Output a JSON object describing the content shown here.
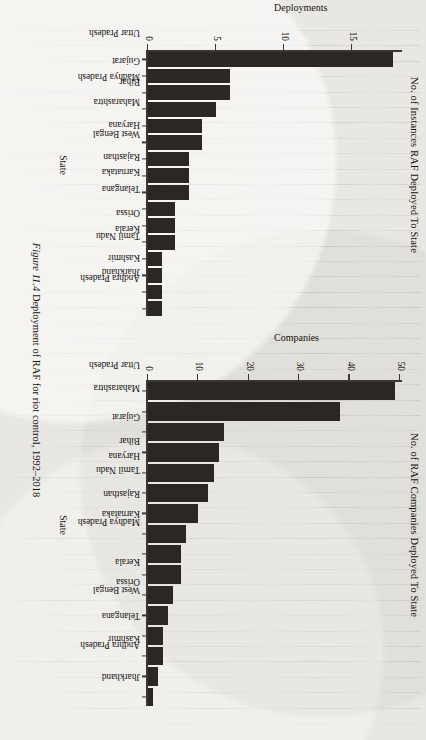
{
  "figure": {
    "caption_label": "Figure 11.4",
    "caption_text": "Deployment of RAF for riot control, 1992–2018"
  },
  "chart_data": [
    {
      "id": "instances",
      "type": "bar",
      "orientation": "vertical",
      "title": "No. of Instances RAF Deployed To State",
      "xlabel": "State",
      "ylabel": "Deployments",
      "ylim": [
        0,
        18.5
      ],
      "yticks": [
        0,
        5,
        10,
        15
      ],
      "grid": false,
      "legend": "none",
      "bar_color": "#2a2724",
      "categories": [
        "Uttar Pradesh",
        "Gujarat",
        "Bihar",
        "Madhya Pradesh",
        "Maharashtra",
        "Haryana",
        "West Bengal",
        "Rajasthan",
        "Karnataka",
        "Telangana",
        "Orissa",
        "Kerala",
        "Tamil Nadu",
        "Kashmir",
        "Jharkhand",
        "Andhra Pradesh"
      ],
      "values": [
        18,
        6,
        6,
        5,
        4,
        4,
        3,
        3,
        3,
        2,
        2,
        2,
        1,
        1,
        1,
        1
      ]
    },
    {
      "id": "companies",
      "type": "bar",
      "orientation": "vertical",
      "title": "No. of RAF Companies Deployed To State",
      "xlabel": "State",
      "ylabel": "Companies",
      "ylim": [
        0,
        50
      ],
      "yticks": [
        0,
        10,
        20,
        30,
        40,
        50
      ],
      "grid": false,
      "legend": "none",
      "bar_color": "#2a2724",
      "categories": [
        "Uttar Pradesh",
        "Maharashtra",
        "Gujarat",
        "Bihar",
        "Haryana",
        "Tamil Nadu",
        "Rajasthan",
        "Karnataka",
        "Madhya Pradesh",
        "Kerala",
        "Orissa",
        "West Bengal",
        "Telangana",
        "Kashmir",
        "Andhra Pradesh",
        "Jharkhand"
      ],
      "values": [
        49,
        38,
        15,
        14,
        13,
        12,
        10,
        7.5,
        6.5,
        6.5,
        5,
        4,
        3,
        3,
        2,
        1
      ]
    }
  ]
}
